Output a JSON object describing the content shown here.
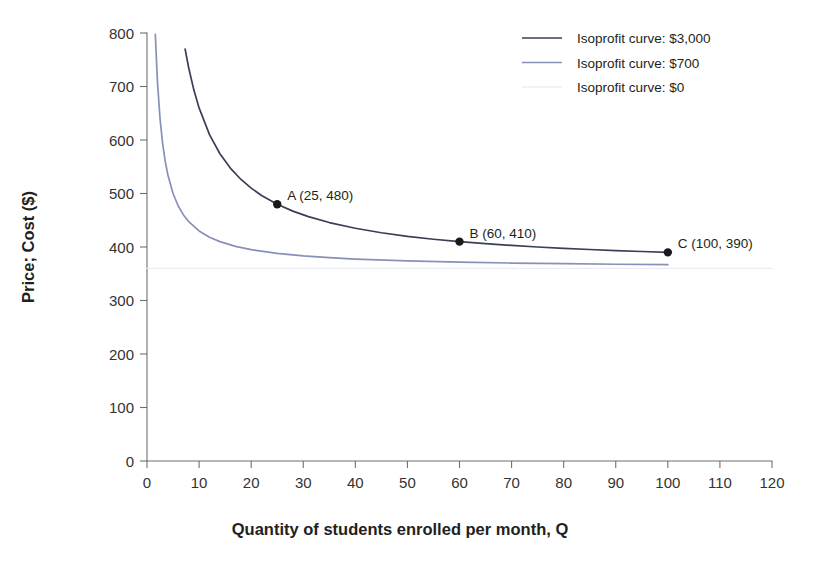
{
  "chart_data": {
    "type": "line",
    "title": "",
    "xlabel": "Quantity of students enrolled per month, Q",
    "ylabel": "Price; Cost ($)",
    "xlim": [
      0,
      120
    ],
    "ylim": [
      0,
      800
    ],
    "xticks": [
      0,
      10,
      20,
      30,
      40,
      50,
      60,
      70,
      80,
      90,
      100,
      110,
      120
    ],
    "yticks": [
      0,
      100,
      200,
      300,
      400,
      500,
      600,
      700,
      800
    ],
    "grid": false,
    "legend_position": "top-right",
    "average_cost": 360,
    "note": "Isoprofit curves P = AC + profit/Q with AC = 360",
    "series": [
      {
        "name": "Isoprofit curve: $3,000",
        "profit": 3000,
        "color": "#3a3f55",
        "x": [
          7.32,
          8,
          9,
          10,
          12,
          14,
          16,
          18,
          20,
          22,
          25,
          28,
          31,
          35,
          40,
          45,
          50,
          55,
          60,
          65,
          70,
          75,
          80,
          85,
          90,
          95,
          100
        ],
        "y": [
          770,
          735,
          693.3,
          660,
          610,
          574.3,
          547.5,
          526.7,
          510,
          496.4,
          480,
          467.1,
          456.8,
          445.7,
          435,
          426.7,
          420,
          414.5,
          410,
          406.2,
          402.9,
          400,
          397.5,
          395.3,
          393.3,
          391.6,
          390
        ]
      },
      {
        "name": "Isoprofit curve: $700",
        "profit": 700,
        "color": "#8890b8",
        "x": [
          1.6,
          2,
          2.5,
          3,
          3.5,
          4,
          5,
          6,
          7,
          8,
          10,
          12,
          14,
          17,
          20,
          25,
          30,
          35,
          40,
          50,
          60,
          70,
          80,
          90,
          100
        ],
        "y": [
          797.5,
          710,
          640,
          593.3,
          560,
          535,
          500,
          476.7,
          460,
          447.5,
          430,
          418.3,
          410,
          401.2,
          395,
          388,
          383.3,
          380,
          377.5,
          374,
          371.7,
          370,
          368.8,
          367.8,
          367
        ]
      },
      {
        "name": "Isoprofit curve: $0",
        "profit": 0,
        "color": "#ecedf3",
        "x": [
          0,
          120
        ],
        "y": [
          360,
          360
        ]
      }
    ],
    "points": [
      {
        "id": "A",
        "label": "A (25, 480)",
        "x": 25,
        "y": 480
      },
      {
        "id": "B",
        "label": "B (60, 410)",
        "x": 60,
        "y": 410
      },
      {
        "id": "C",
        "label": "C (100, 390)",
        "x": 100,
        "y": 390
      }
    ],
    "legend": [
      {
        "label": "Isoprofit curve: $3,000",
        "color": "#3a3f55"
      },
      {
        "label": "Isoprofit curve: $700",
        "color": "#8890b8"
      },
      {
        "label": "Isoprofit curve: $0",
        "color": "#ecedf3"
      }
    ]
  },
  "axes": {
    "x_title": "Quantity of students enrolled per month, Q",
    "y_title": "Price; Cost ($)",
    "x_tick_labels": [
      "0",
      "10",
      "20",
      "30",
      "40",
      "50",
      "60",
      "70",
      "80",
      "90",
      "100",
      "110",
      "120"
    ],
    "y_tick_labels": [
      "0",
      "100",
      "200",
      "300",
      "400",
      "500",
      "600",
      "700",
      "800"
    ]
  },
  "colors": {
    "curve_3000": "#3a3f55",
    "curve_700": "#8890b8",
    "curve_0": "#ecedf3",
    "axis": "#6f6f6f",
    "text": "#231f20"
  }
}
